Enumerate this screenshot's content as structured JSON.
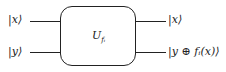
{
  "diagram": {
    "type": "quantum-circuit-oracle",
    "inputs": [
      {
        "label": "|x⟩"
      },
      {
        "label": "|y⟩"
      }
    ],
    "gate": {
      "label": "U",
      "subscript": "fᵢ"
    },
    "outputs": [
      {
        "label": "|x⟩"
      },
      {
        "label": "|y ⊕ fᵢ(x)⟩"
      }
    ]
  }
}
